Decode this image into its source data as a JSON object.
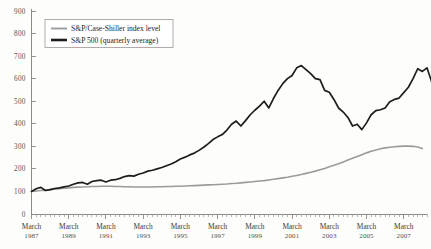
{
  "chart_data": {
    "type": "line",
    "title": "",
    "subtitle": "",
    "xlabel": "",
    "ylabel": "",
    "ylim": [
      0,
      900
    ],
    "y_ticks": [
      0,
      100,
      200,
      300,
      400,
      500,
      600,
      700,
      800,
      900
    ],
    "grid": false,
    "legend_position": "top-left",
    "x_tick_month": "March",
    "x_tick_years": [
      "1987",
      "1989",
      "1991",
      "1993",
      "1995",
      "1997",
      "1999",
      "2001",
      "2003",
      "2005",
      "2007"
    ],
    "x_minor_ticks_per_major": 8,
    "x_range_quarters": 85,
    "series": [
      {
        "name": "S&P/Case-Shiller index level",
        "color": "#9b9b9b",
        "width": 1.6,
        "values": [
          100,
          102,
          104,
          106,
          108,
          110,
          112,
          114,
          116,
          118,
          119,
          120,
          121,
          122,
          122,
          123,
          123,
          123,
          122,
          122,
          121,
          121,
          120,
          120,
          120,
          120,
          120,
          121,
          121,
          122,
          122,
          123,
          123,
          124,
          125,
          126,
          127,
          128,
          129,
          130,
          131,
          132,
          133,
          135,
          136,
          138,
          140,
          142,
          144,
          146,
          148,
          151,
          154,
          157,
          160,
          163,
          167,
          171,
          175,
          180,
          185,
          190,
          196,
          202,
          209,
          216,
          223,
          231,
          239,
          247,
          255,
          263,
          271,
          278,
          284,
          289,
          293,
          296,
          298,
          300,
          301,
          301,
          300,
          297,
          290
        ]
      },
      {
        "name": "S&P 500 (quarterly average)",
        "color": "#1f1d1b",
        "width": 1.7,
        "values": [
          100,
          112,
          118,
          104,
          108,
          113,
          116,
          120,
          124,
          132,
          138,
          140,
          132,
          144,
          148,
          150,
          142,
          150,
          152,
          158,
          166,
          170,
          168,
          176,
          182,
          190,
          194,
          200,
          206,
          214,
          222,
          232,
          244,
          252,
          262,
          270,
          282,
          296,
          312,
          330,
          342,
          352,
          372,
          398,
          412,
          390,
          414,
          440,
          460,
          478,
          500,
          470,
          512,
          548,
          578,
          600,
          614,
          648,
          658,
          640,
          622,
          600,
          596,
          548,
          540,
          508,
          470,
          452,
          428,
          390,
          398,
          374,
          404,
          440,
          458,
          462,
          470,
          498,
          508,
          514,
          538,
          562,
          600,
          644,
          632,
          648,
          586
        ]
      }
    ]
  },
  "legend": {
    "items": [
      {
        "label": "S&P/Case-Shiller index level",
        "swatch_color": "#9b9b9b"
      },
      {
        "label": "S&P 500 (quarterly average)",
        "swatch_color": "#1f1d1b"
      }
    ]
  },
  "colors": {
    "background": "#fdfdfb",
    "axis": "#8d8a85",
    "text": "#262320",
    "case_shiller": "#9b9b9b",
    "sp500": "#1f1d1b"
  }
}
